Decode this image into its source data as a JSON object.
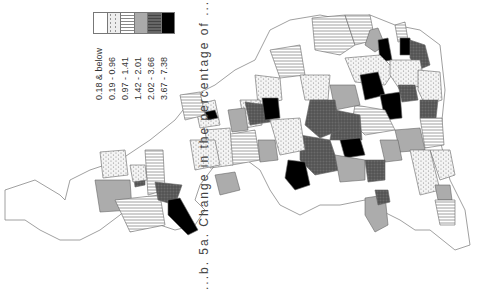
{
  "legend": {
    "classes": [
      {
        "label": "0.18 & below",
        "pattern": "blank",
        "color": "#ffffff"
      },
      {
        "label": "0.19 - 0.96",
        "pattern": "dots",
        "color": "#e8e8e8"
      },
      {
        "label": "0.97 - 1.41",
        "pattern": "hlines",
        "color": "#d0d0d0"
      },
      {
        "label": "1.42 - 2.01",
        "pattern": "grey",
        "color": "#a8a8a8"
      },
      {
        "label": "2.02 - 3.66",
        "pattern": "darkgrey",
        "color": "#585858"
      },
      {
        "label": "3.67 - 7.38",
        "pattern": "black",
        "color": "#000000"
      }
    ]
  },
  "caption": "...b. 5a. Change in the percentage of ..."
}
